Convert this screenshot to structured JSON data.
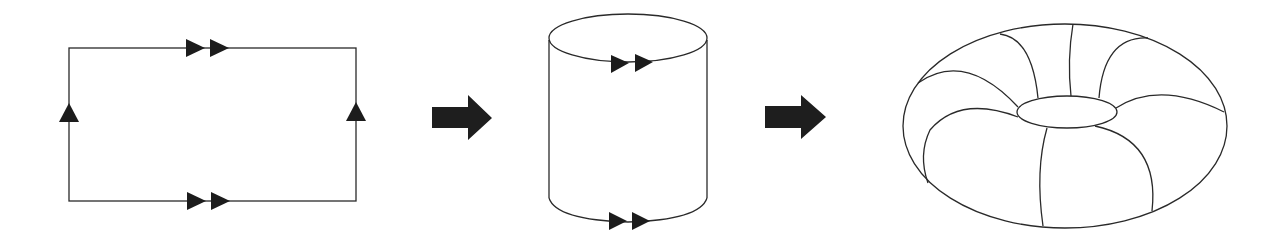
{
  "diagram": {
    "stages": [
      {
        "id": "rectangle",
        "label": "Square with edge identifications",
        "edge_markers": {
          "top": "double-arrow-right",
          "bottom": "double-arrow-right",
          "left": "single-arrow-up",
          "right": "single-arrow-up"
        }
      },
      {
        "id": "cylinder",
        "label": "Cylinder (left and right edges glued)",
        "edge_markers": {
          "top_circle": "double-arrow-right",
          "bottom_circle": "double-arrow-right"
        }
      },
      {
        "id": "torus",
        "label": "Torus (top and bottom circles glued)"
      }
    ],
    "transitions": [
      "arrow-right",
      "arrow-right"
    ],
    "colors": {
      "line": "#2a2a2a",
      "fill": "#1c1c1c",
      "background": "#ffffff"
    }
  }
}
